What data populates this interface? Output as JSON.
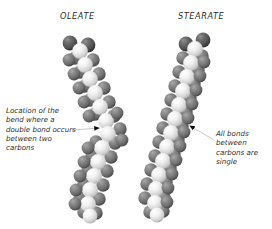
{
  "figure": {
    "background_color": "#ffffff",
    "width": 272,
    "height": 229
  },
  "molecules": [
    {
      "id": "oleate",
      "title": "OLEATE",
      "shape": "bent",
      "description": "Space-filling model of an 18-carbon unsaturated fatty acid chain with a kink at the cis double bond",
      "carbon_color": "#e8e8e8",
      "hydrogen_color": "#6d6d6d",
      "oxygen_color": "#4a4a4a",
      "atoms": {
        "carboxylate_oxygens": 2,
        "backbone_carbons": 18
      }
    },
    {
      "id": "stearate",
      "title": "STEARATE",
      "shape": "straight",
      "description": "Space-filling model of an 18-carbon saturated fatty acid chain, fully extended and straight",
      "carbon_color": "#e8e8e8",
      "hydrogen_color": "#6d6d6d",
      "oxygen_color": "#4a4a4a",
      "atoms": {
        "carboxylate_oxygens": 2,
        "backbone_carbons": 18
      }
    }
  ],
  "callouts": [
    {
      "id": "left",
      "text": "Location of the bend where a double bond occurs between two carbons",
      "target_molecule": "oleate",
      "leader_color": "#b9b9b9",
      "arrow_color": "#101010"
    },
    {
      "id": "right",
      "text": "All bonds between carbons are single",
      "target_molecule": "stearate",
      "leader_color": "#b9b9b9",
      "arrow_color": "#101010"
    }
  ]
}
